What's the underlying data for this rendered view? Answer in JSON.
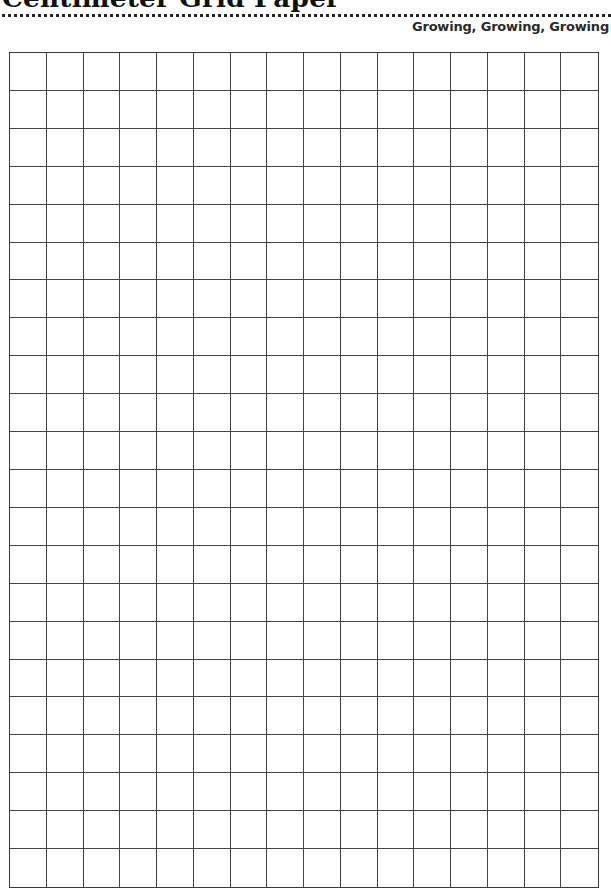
{
  "header": {
    "title": "Centimeter Grid Paper",
    "subtitle": "Growing, Growing, Growing"
  },
  "grid": {
    "columns": 16,
    "rows": 22,
    "line_color": "#444444",
    "background": "#ffffff"
  }
}
